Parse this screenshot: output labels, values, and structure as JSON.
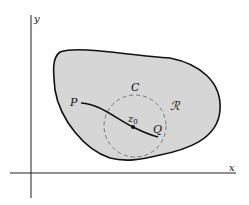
{
  "figure": {
    "axes": {
      "x_label": "x",
      "y_label": "y"
    },
    "region": {
      "label": "ℛ",
      "fill_color": "#d6d6d6",
      "stroke_color": "#111111"
    },
    "circle": {
      "label": "C",
      "style": "dashed",
      "stroke_color": "#777777"
    },
    "curve": {
      "start_label": "P",
      "end_label": "Q",
      "point_label": "z",
      "point_subscript": "0"
    }
  }
}
